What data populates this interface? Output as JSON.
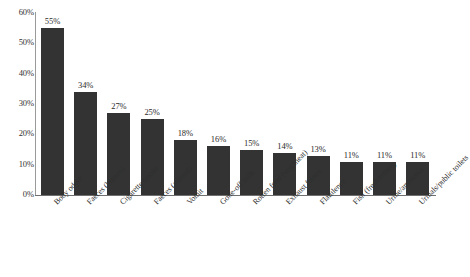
{
  "chart_data": {
    "type": "bar",
    "title": "",
    "subtitle": "",
    "xlabel": "",
    "ylabel": "",
    "ylim": [
      0,
      60
    ],
    "grid": false,
    "legend": false,
    "y_ticks": [
      "0%",
      "10%",
      "20%",
      "30%",
      "40%",
      "50%",
      "60%"
    ],
    "y_tick_values": [
      0,
      10,
      20,
      30,
      40,
      50,
      60
    ],
    "categories": [
      "Body odour",
      "Faeces (human)",
      "Cigarette smoke",
      "Faeces (animal)",
      "Vomit",
      "Gone-off milk",
      "Rotten food (veg/meat)",
      "Exhaust fumes",
      "Flatulence",
      "Fish (fresh/rotten)",
      "Urine/ammonia",
      "Urinals/public toilets"
    ],
    "values": [
      55,
      34,
      27,
      25,
      18,
      16,
      15,
      14,
      13,
      11,
      11,
      11
    ],
    "value_labels": [
      "55%",
      "34%",
      "27%",
      "25%",
      "18%",
      "16%",
      "15%",
      "14%",
      "13%",
      "11%",
      "11%",
      "11%"
    ],
    "bar_color": "#333333",
    "axis_color": "#6f6f6f",
    "background_color": "#ffffff"
  }
}
